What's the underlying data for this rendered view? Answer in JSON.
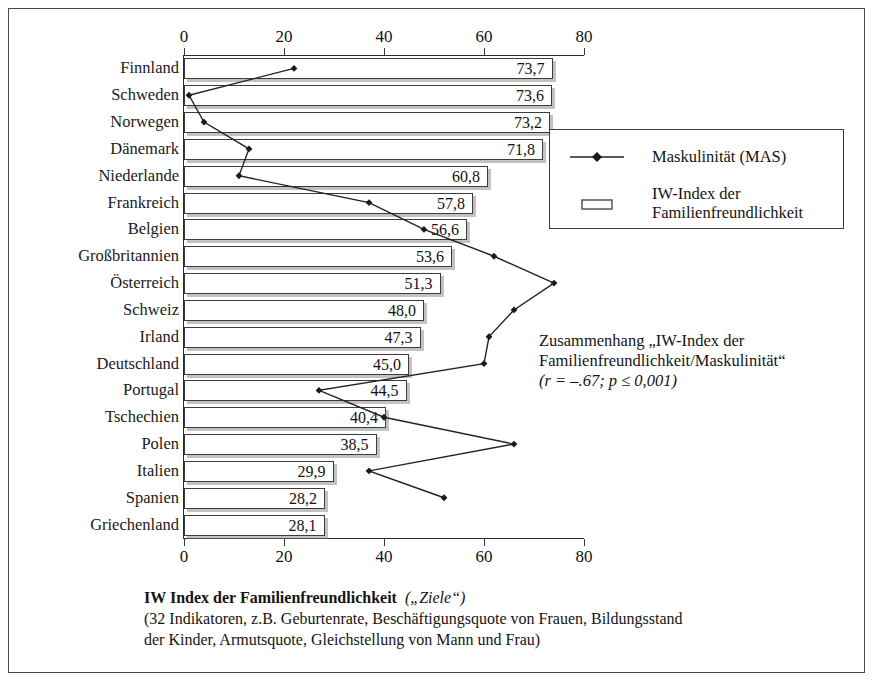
{
  "chart_data": {
    "type": "bar",
    "orientation": "horizontal",
    "title": "IW Index der Familienfreundlichkeit („Ziele“)",
    "categories": [
      "Finnland",
      "Schweden",
      "Norwegen",
      "Dänemark",
      "Niederlande",
      "Frankreich",
      "Belgien",
      "Großbritannien",
      "Österreich",
      "Schweiz",
      "Irland",
      "Deutschland",
      "Portugal",
      "Tschechien",
      "Polen",
      "Italien",
      "Spanien",
      "Griechenland"
    ],
    "series": [
      {
        "name": "IW-Index der Familienfreundlichkeit",
        "type": "bar",
        "values": [
          73.7,
          73.6,
          73.2,
          71.8,
          60.8,
          57.8,
          56.6,
          53.6,
          51.3,
          48.0,
          47.3,
          45.0,
          44.5,
          40.4,
          38.5,
          29.9,
          28.2,
          28.1
        ],
        "labels": [
          "73,7",
          "73,6",
          "73,2",
          "71,8",
          "60,8",
          "57,8",
          "56,6",
          "53,6",
          "51,3",
          "48,0",
          "47,3",
          "45,0",
          "44,5",
          "40,4",
          "38,5",
          "29,9",
          "28,2",
          "28,1"
        ]
      },
      {
        "name": "Maskulinität (MAS)",
        "type": "line",
        "values": [
          22,
          1,
          4,
          13,
          11,
          37,
          48,
          62,
          74,
          66,
          61,
          60,
          27,
          40,
          66,
          37,
          52,
          null
        ]
      }
    ],
    "xlabel": "",
    "ylabel": "",
    "xlim": [
      0,
      80
    ],
    "xticks": [
      0,
      20,
      40,
      60,
      80
    ],
    "xticklabels": [
      "0",
      "20",
      "40",
      "60",
      "80"
    ],
    "axis_top": true,
    "axis_bottom": true,
    "grid": false,
    "legend_position": "right-top"
  },
  "legend": {
    "items": [
      {
        "label": "Maskulinität (MAS)",
        "marker": "line-diamond-marker",
        "color": "#222222"
      },
      {
        "label_line1": "IW-Index der",
        "label_line2": "Familienfreundlichkeit",
        "marker": "bar-swatch",
        "color": "#ffffff"
      }
    ]
  },
  "annotation": {
    "line1": "Zusammenhang „IW-Index der",
    "line2": "Familienfreundlichkeit/Maskulinität“",
    "line3": "(r = –.67;  p ≤ 0,001)"
  },
  "caption": {
    "title_bold": "IW Index der Familienfreundlichkeit",
    "title_italic": "(„Ziele“)",
    "line2": "(32 Indikatoren, z.B. Geburtenrate, Beschäftigungsquote von Frauen, Bildungsstand",
    "line3": "der Kinder, Armutsquote, Gleichstellung von Mann und Frau)"
  },
  "colors": {
    "frame": "#4a4a4a",
    "bar_border": "#3c3c3c",
    "bar_fill": "#ffffff",
    "line": "#222222",
    "axis": "#2a2a2a",
    "text": "#141414"
  }
}
